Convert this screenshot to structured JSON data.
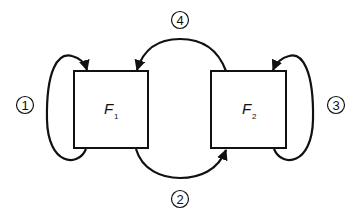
{
  "diagram": {
    "nodes": [
      {
        "id": "F1",
        "label": "F",
        "subscript": "1"
      },
      {
        "id": "F2",
        "label": "F",
        "subscript": "2"
      }
    ],
    "edges": [
      {
        "id": "1",
        "label": "1",
        "from": "F1",
        "to": "F1",
        "type": "self-loop"
      },
      {
        "id": "2",
        "label": "2",
        "from": "F1",
        "to": "F2",
        "type": "bottom-arc"
      },
      {
        "id": "3",
        "label": "3",
        "from": "F2",
        "to": "F2",
        "type": "self-loop"
      },
      {
        "id": "4",
        "label": "4",
        "from": "F2",
        "to": "F1",
        "type": "top-arc"
      }
    ],
    "colors": {
      "stroke": "#111111",
      "background": "#ffffff"
    }
  }
}
